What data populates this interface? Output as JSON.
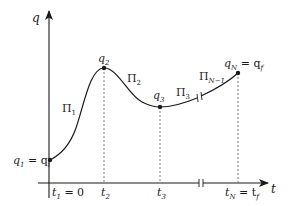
{
  "figure": {
    "title": "",
    "axes": {
      "x_label": "t",
      "y_label": "q"
    },
    "points": [
      {
        "id": "q1",
        "label_main": "q",
        "label_sub": "1",
        "label_eq": " = q",
        "label_eq_sub": "i"
      },
      {
        "id": "q2",
        "label_main": "q",
        "label_sub": "2"
      },
      {
        "id": "q3",
        "label_main": "q",
        "label_sub": "3"
      },
      {
        "id": "qN",
        "label_main": "q",
        "label_sub": "N",
        "label_eq": " = q",
        "label_eq_sub": "f"
      }
    ],
    "time_ticks": [
      {
        "id": "t1",
        "main": "t",
        "sub": "1",
        "eq": " = 0"
      },
      {
        "id": "t2",
        "main": "t",
        "sub": "2"
      },
      {
        "id": "t3",
        "main": "t",
        "sub": "3"
      },
      {
        "id": "tN",
        "main": "t",
        "sub": "N",
        "eq": " = t",
        "eq_sub": "f"
      }
    ],
    "segments": [
      {
        "id": "pi1",
        "main": "Π",
        "sub": "1"
      },
      {
        "id": "pi2",
        "main": "Π",
        "sub": "2"
      },
      {
        "id": "pi3",
        "main": "Π",
        "sub": "3"
      },
      {
        "id": "piN1",
        "main": "Π",
        "sub": "N−1"
      }
    ],
    "colors": {
      "line": "#1a1a1a",
      "dashed": "#555555",
      "background": "#ffffff"
    }
  }
}
